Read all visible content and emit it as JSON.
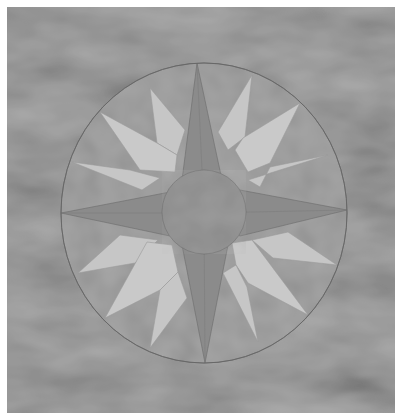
{
  "image": {
    "subject": "Mariner's compass quilt block on mottled fabric background",
    "caption": "Mariner's compass quilt block",
    "colors": {
      "border": "#ffffff",
      "background": "#8e8e8e",
      "background_light": "#a8a8a8",
      "background_dark": "#767676",
      "circle_fill": "#969696",
      "main_star": "#8a8a8a",
      "light_points": "#c6c6c6",
      "light_points_shade": "#b8b8b8",
      "center_circle": "#8d8d8d",
      "seam": "#6a6a6a"
    },
    "compass": {
      "center": [
        204,
        213
      ],
      "outer_rx": 143,
      "outer_ry": 150,
      "center_circle_radius": 42,
      "main_points": 4,
      "secondary_points": 4,
      "tertiary_points": 8
    }
  }
}
